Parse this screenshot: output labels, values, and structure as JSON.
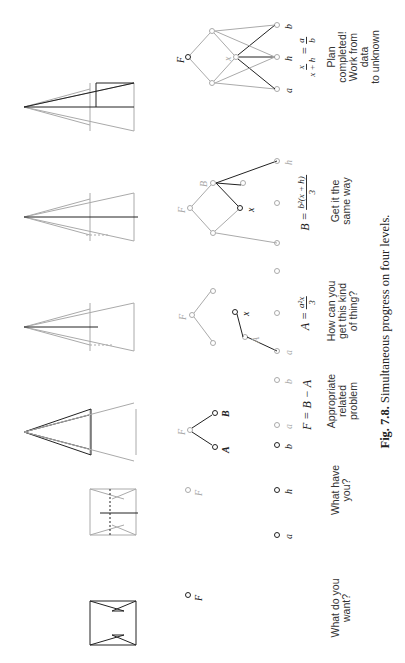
{
  "figure": {
    "number": "Fig. 7.8.",
    "caption": "Simultaneous progress on four levels.",
    "orientation": "rotated 90° counter-clockwise"
  },
  "columns": [
    {
      "question": "What do you\nwant?",
      "equation": "",
      "nodes": [
        "F"
      ]
    },
    {
      "question": "What have\nyou?",
      "equation": "",
      "nodes": [
        "F",
        "a",
        "h",
        "b"
      ]
    },
    {
      "question": "Appropriate\nrelated\nproblem",
      "equation": "F = B − A",
      "nodes": [
        "F",
        "A",
        "B",
        "a",
        "b"
      ]
    },
    {
      "question": "How can you\nget this kind\nof thing?",
      "equation_lhs": "A =",
      "equation_num": "a²x",
      "equation_den": "3",
      "nodes": [
        "F",
        "A",
        "x",
        "a"
      ]
    },
    {
      "question": "Get it the\nsame way",
      "equation_lhs": "B =",
      "equation_num": "b²(x + h)",
      "equation_den": "3",
      "nodes": [
        "F",
        "B",
        "x",
        "h"
      ]
    },
    {
      "question": "Plan completed!\nWork from data\nto unknown",
      "equation_num1": "x",
      "equation_den1": "x + h",
      "equation_num2": "a",
      "equation_den2": "b",
      "nodes": [
        "F",
        "x",
        "a",
        "h",
        "b"
      ]
    }
  ],
  "colors": {
    "ink": "#222222",
    "faded": "#aaaaaa"
  }
}
